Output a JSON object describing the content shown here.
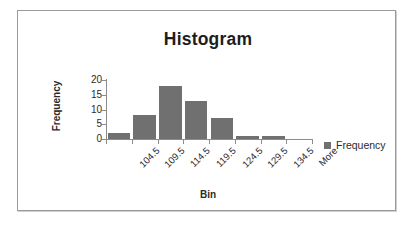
{
  "chart_data": {
    "type": "bar",
    "title": "Histogram",
    "xlabel": "Bin",
    "ylabel": "Frequency",
    "categories": [
      "104.5",
      "109.5",
      "114.5",
      "119.5",
      "124.5",
      "129.5",
      "134.5",
      "More"
    ],
    "values": [
      2,
      8,
      18,
      13,
      7,
      1,
      1,
      0
    ],
    "series": [
      {
        "name": "Frequency",
        "values": [
          2,
          8,
          18,
          13,
          7,
          1,
          1,
          0
        ]
      }
    ],
    "yticks": [
      0,
      5,
      10,
      15,
      20
    ],
    "ylim": [
      0,
      20
    ],
    "grid": false,
    "legend": {
      "position": "right",
      "entries": [
        "Frequency"
      ]
    },
    "colors": {
      "bar": "#707070",
      "axis": "#8c8c8c",
      "text": "#2b2b2b",
      "title": "#1d1d1d",
      "frame_border": "#9a9a9a",
      "background": "#ffffff"
    }
  }
}
